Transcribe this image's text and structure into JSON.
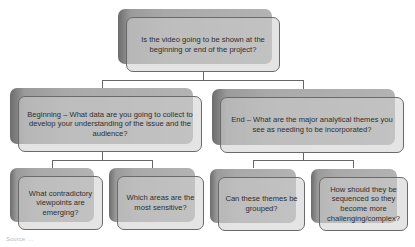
{
  "diagram": {
    "root": {
      "text": "Is the video going to be shown at the beginning or end of the project?"
    },
    "branches": [
      {
        "text": "Beginning – What data are you going to collect to develop your understanding of the issue and the audience?",
        "children": [
          {
            "text": "What contradictory viewpoints are emerging?"
          },
          {
            "text": "Which areas are the most sensitive?"
          }
        ]
      },
      {
        "text": "End – What are the major analytical themes you see as needing to be incorporated?",
        "children": [
          {
            "text": "Can these themes be grouped?"
          },
          {
            "text": "How should they be sequenced so they become more challenging/complex?"
          }
        ]
      }
    ],
    "source": "Source: ..."
  }
}
